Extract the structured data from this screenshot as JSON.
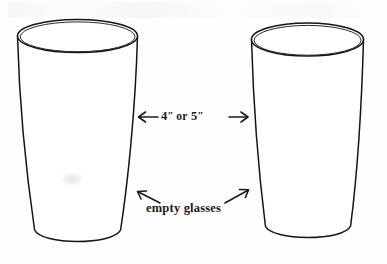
{
  "figure": {
    "background_color": "#fefefe",
    "ink_color": "#1a1a1a",
    "width": 387,
    "height": 264
  },
  "annotations": {
    "dimension": {
      "left_arrow": "left-arrow-icon",
      "value": "4",
      "inch_mark_1": "″",
      "conjunction": "or",
      "value_alt": "5",
      "inch_mark_2": "″",
      "right_arrow": "right-arrow-icon",
      "full_text": "4″ or 5″"
    },
    "caption": {
      "left_arrow": "diagonal-left-arrow-icon",
      "text": "empty glasses",
      "right_arrow": "diagonal-right-arrow-icon"
    }
  },
  "objects": [
    {
      "name": "left-glass",
      "label": "empty glass",
      "shape": "tapered-tumbler",
      "rim_visible": true
    },
    {
      "name": "right-glass",
      "label": "empty glass",
      "shape": "tapered-tumbler",
      "rim_visible": true
    }
  ]
}
